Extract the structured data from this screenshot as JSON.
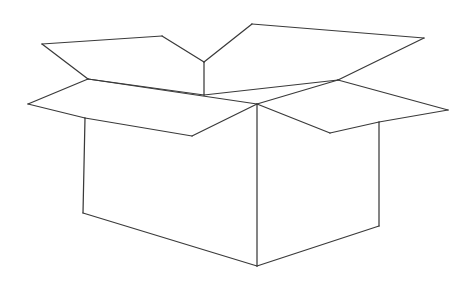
{
  "figure": {
    "style": "line-art outline drawing",
    "background_color": "#ffffff",
    "stroke_color": "#3a3a3a",
    "stroke_width": 1.25,
    "canvas": {
      "width": 475,
      "height": 285
    }
  },
  "geometry": {
    "points": {
      "rim_left": [
        28,
        104
      ],
      "rim_back_left": [
        88,
        79
      ],
      "rim_back_right": [
        338,
        80
      ],
      "rim_right": [
        448,
        110
      ],
      "rim_front_left": [
        85,
        118
      ],
      "rim_front_right": [
        379,
        122
      ],
      "center_top": [
        204,
        62
      ],
      "center_mid": [
        204,
        95
      ],
      "center_front": [
        257,
        104
      ],
      "body_bottom_left": [
        83,
        213
      ],
      "body_bottom_front": [
        257,
        266
      ],
      "body_bottom_right": [
        379,
        226
      ],
      "flap_left_tip": [
        42,
        44
      ],
      "flap_left_top_right": [
        162,
        36
      ],
      "flap_right_top_left": [
        252,
        24
      ],
      "flap_right_top_right": [
        424,
        38
      ],
      "flap_front_left_v": [
        192,
        136
      ],
      "flap_front_right_v": [
        330,
        133
      ]
    },
    "shapes": {
      "box_body": "M 85,118 L 85,213 L 257,266 L 379,226 L 379,122 L 257,104 Z",
      "rim_top": "M 88,79 L 338,80 L 379,122 L 85,118 Z",
      "flap_back_left": "M 88,79 L 42,44 L 162,36 L 204,62 L 204,95 Z",
      "flap_back_right": "M 204,62 L 252,24 L 424,38 L 338,80 L 204,95 Z",
      "flap_front_left": "M 85,118 L 28,104 L 88,79 L 257,104 L 192,136 Z",
      "flap_front_right": "M 379,122 L 338,80 L 448,110 L 330,133 L 257,104 Z"
    },
    "edges": [
      {
        "name": "left-flap-upper-left",
        "from": "rim_back_left",
        "to": "flap_left_tip"
      },
      {
        "name": "left-flap-top",
        "from": "flap_left_tip",
        "to": "flap_left_top_right"
      },
      {
        "name": "left-flap-upper-right",
        "from": "flap_left_top_right",
        "to": "center_top"
      },
      {
        "name": "center-vertical",
        "from": "center_top",
        "to": "center_mid"
      },
      {
        "name": "left-flap-fold",
        "from": "center_mid",
        "to": "rim_back_left"
      },
      {
        "name": "right-flap-upper-left",
        "from": "center_top",
        "to": "flap_right_top_left"
      },
      {
        "name": "right-flap-top",
        "from": "flap_right_top_left",
        "to": "flap_right_top_right"
      },
      {
        "name": "right-flap-upper-right",
        "from": "flap_right_top_right",
        "to": "rim_back_right"
      },
      {
        "name": "right-flap-fold",
        "from": "rim_back_right",
        "to": "center_mid"
      },
      {
        "name": "rim-back-left-to-left",
        "from": "rim_back_left",
        "to": "rim_left"
      },
      {
        "name": "rim-left-to-front-left",
        "from": "rim_left",
        "to": "rim_front_left"
      },
      {
        "name": "front-left-flap-lower",
        "from": "rim_front_left",
        "to": "flap_front_left_v"
      },
      {
        "name": "front-left-flap-inner",
        "from": "flap_front_left_v",
        "to": "center_front"
      },
      {
        "name": "front-left-flap-fold",
        "from": "center_front",
        "to": "rim_back_left"
      },
      {
        "name": "rim-back-right-to-right",
        "from": "rim_back_right",
        "to": "rim_right"
      },
      {
        "name": "rim-right-to-front-right",
        "from": "rim_right",
        "to": "rim_front_right"
      },
      {
        "name": "front-right-flap-lower",
        "from": "rim_front_right",
        "to": "flap_front_right_v"
      },
      {
        "name": "front-right-flap-inner",
        "from": "flap_front_right_v",
        "to": "center_front"
      },
      {
        "name": "front-right-flap-fold",
        "from": "center_front",
        "to": "rim_back_right"
      },
      {
        "name": "body-left-vertical",
        "from": "rim_front_left",
        "to": "body_bottom_left"
      },
      {
        "name": "body-front-vertical",
        "from": "center_front",
        "to": "body_bottom_front"
      },
      {
        "name": "body-right-vertical",
        "from": "rim_front_right",
        "to": "body_bottom_right"
      },
      {
        "name": "body-bottom-left-edge",
        "from": "body_bottom_left",
        "to": "body_bottom_front"
      },
      {
        "name": "body-bottom-right-edge",
        "from": "body_bottom_front",
        "to": "body_bottom_right"
      }
    ]
  }
}
